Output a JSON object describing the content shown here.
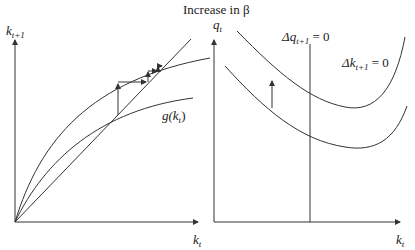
{
  "title": "Increase in β",
  "left_panel": {
    "y_axis_label": "k",
    "y_axis_sub": "t+1",
    "x_axis_label": "k",
    "x_axis_sub": "t",
    "curve_label": "g(k",
    "curve_label_sub": "t",
    "curve_label_close": ")"
  },
  "right_panel": {
    "y_axis_label": "q",
    "y_axis_sub": "t",
    "x_axis_label": "k",
    "x_axis_sub": "t",
    "dq_label_prefix": "Δq",
    "dq_label_sub": "t+1",
    "dq_label_suffix": " = 0",
    "dk_label_prefix": "Δk",
    "dk_label_sub": "t+1",
    "dk_label_suffix": " = 0"
  },
  "colors": {
    "line": "#333333",
    "background": "#ffffff"
  }
}
